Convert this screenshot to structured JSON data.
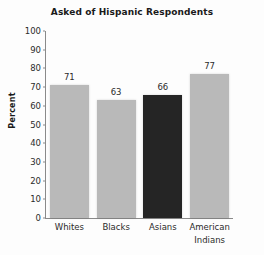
{
  "chart_data": {
    "type": "bar",
    "title": "Asked of Hispanic Respondents",
    "xlabel": "",
    "ylabel": "Percent",
    "categories": [
      "Whites",
      "Blacks",
      "Asians",
      "American Indians"
    ],
    "category_lines": [
      [
        "Whites"
      ],
      [
        "Blacks"
      ],
      [
        "Asians"
      ],
      [
        "American",
        "Indians"
      ]
    ],
    "values": [
      71,
      63,
      66,
      77
    ],
    "value_labels": [
      "71",
      "63",
      "66",
      "77"
    ],
    "ylim": [
      0,
      100
    ],
    "ytick_values": [
      100,
      90,
      80,
      70,
      60,
      50,
      40,
      30,
      20,
      10,
      0
    ],
    "ytick_labels": [
      "100",
      "90",
      "80",
      "70",
      "60",
      "50",
      "40",
      "30",
      "20",
      "10",
      "0"
    ],
    "grid": false,
    "legend": "none",
    "bar_colors": [
      "#b9b9b9",
      "#b9b9b9",
      "#252525",
      "#b9b9b9"
    ],
    "highlight_index": 2,
    "axis_color": "#8a8a8a",
    "text_color": "#2b2b2b",
    "background": "#fdfdfd"
  }
}
